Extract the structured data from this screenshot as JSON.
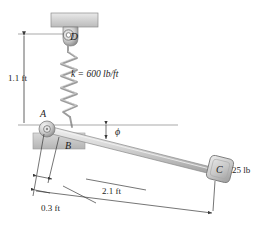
{
  "figure": {
    "type": "statics-free-body-diagram",
    "background_color": "#ffffff",
    "ink_color": "#1d1d1d"
  },
  "labels": {
    "point_D": "D",
    "point_A": "A",
    "point_B": "B",
    "point_C": "C",
    "angle_phi": "ϕ",
    "spring_constant": "k = 600 lb/ft",
    "height_dimension": "1.1 ft",
    "short_dimension": "0.3 ft",
    "long_dimension": "2.1 ft",
    "block_weight": "25 lb"
  },
  "values": {
    "spring_stiffness": 600,
    "spring_stiffness_units": "lb/ft",
    "height": 1.1,
    "height_units": "ft",
    "distance_AB": 0.3,
    "distance_AB_units": "ft",
    "distance_AC": 2.1,
    "distance_AC_units": "ft",
    "weight": 25,
    "weight_units": "lb"
  },
  "icons": {
    "ceiling_support": "ceiling-block-icon",
    "eyelet": "eyelet-ring-icon",
    "spring": "coil-spring-icon",
    "pin_support": "pin-joint-icon",
    "ground_hatch": "fixed-ground-icon",
    "block": "slider-block-icon"
  },
  "colors": {
    "ceiling_fill": "#cfcfcf",
    "metal_light": "#e6e6e6",
    "metal_mid": "#bdbdbd",
    "metal_dark": "#8f8f8f",
    "line": "#3a3a3a"
  }
}
